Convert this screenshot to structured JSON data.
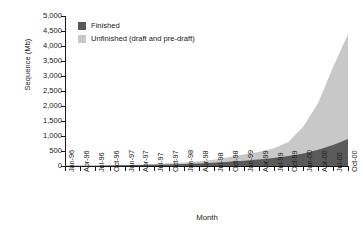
{
  "chart_data": {
    "type": "area",
    "title": "",
    "subtitle": "",
    "xlabel": "Month",
    "ylabel": "Sequence (Mb)",
    "stacked": true,
    "grid": false,
    "legend_position": "top-left",
    "ylim": [
      0,
      5000
    ],
    "ytick_step": 500,
    "ytick_labels": [
      "5,000",
      "4,500",
      "4,000",
      "3,500",
      "3,000",
      "2,500",
      "2,000",
      "1,500",
      "1,000",
      "500",
      "0"
    ],
    "ytick_values": [
      5000,
      4500,
      4000,
      3500,
      3000,
      2500,
      2000,
      1500,
      1000,
      500,
      0
    ],
    "categories": [
      "Jan-96",
      "Apr-96",
      "Jul-96",
      "Oct-96",
      "Jan-97",
      "Apr-97",
      "Jul-97",
      "Oct-97",
      "Jan-98",
      "Apr-98",
      "Jul-98",
      "Oct-98",
      "Jan-99",
      "Apr-99",
      "Jul-99",
      "Oct-99",
      "Jan-00",
      "Apr-00",
      "Jul-00",
      "Oct-00"
    ],
    "series": [
      {
        "name": "Finished",
        "color": "#5a5a5a",
        "values": [
          5,
          8,
          12,
          16,
          22,
          30,
          40,
          52,
          66,
          85,
          110,
          140,
          175,
          215,
          265,
          330,
          420,
          540,
          700,
          900
        ]
      },
      {
        "name": "Unfinished (draft and pre-draft)",
        "color": "#c8c8c8",
        "values": [
          2,
          3,
          5,
          8,
          12,
          18,
          26,
          36,
          50,
          70,
          100,
          150,
          205,
          255,
          320,
          470,
          900,
          1560,
          2600,
          3500
        ]
      }
    ],
    "totals": [
      7,
      11,
      17,
      24,
      34,
      48,
      66,
      88,
      116,
      155,
      210,
      290,
      380,
      470,
      585,
      800,
      1320,
      2100,
      3300,
      4400
    ]
  },
  "legend": {
    "items": [
      {
        "label": "Finished",
        "color": "#5a5a5a"
      },
      {
        "label": "Unfinished (draft and pre-draft)",
        "color": "#c8c8c8"
      }
    ]
  },
  "axes": {
    "y_title": "Sequence (Mb)",
    "x_title": "Month"
  }
}
